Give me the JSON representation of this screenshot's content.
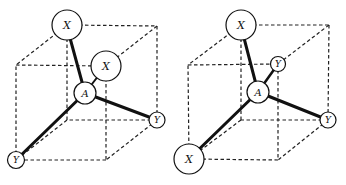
{
  "figure": {
    "left": {
      "atoms": [
        {
          "label": "X",
          "role": "large"
        },
        {
          "label": "X",
          "role": "large"
        },
        {
          "label": "A",
          "role": "center"
        },
        {
          "label": "Y",
          "role": "small"
        },
        {
          "label": "Y",
          "role": "small"
        }
      ]
    },
    "right": {
      "atoms": [
        {
          "label": "X",
          "role": "large"
        },
        {
          "label": "Y",
          "role": "small"
        },
        {
          "label": "A",
          "role": "center"
        },
        {
          "label": "Y",
          "role": "small"
        },
        {
          "label": "X",
          "role": "large"
        }
      ]
    }
  }
}
